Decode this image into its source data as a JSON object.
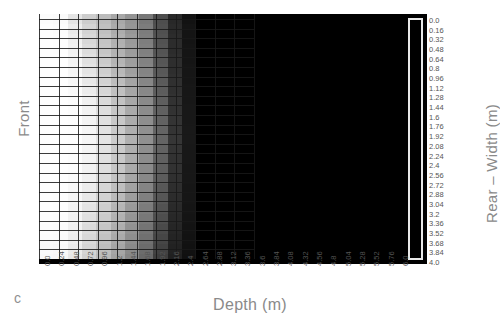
{
  "figure": {
    "panel_letter": "c",
    "left_axis_title": "Front",
    "right_axis_title": "Rear – Width (m)",
    "bottom_axis_title": "Depth (m)",
    "background_color": "#ffffff",
    "plot_background_color": "#000000",
    "gridline_color": "#191919",
    "colorbar": {
      "orientation": "vertical",
      "border_color": "#e8e8e8",
      "fill_color": "#000000",
      "min_label": "0.0",
      "max_label": "4.0"
    }
  },
  "chart_data": {
    "type": "heatmap",
    "title": "",
    "xlabel": "Depth (m)",
    "ylabel": "Front",
    "colorbar_label": "Rear – Width (m)",
    "xlim": [
      0.0,
      6.0
    ],
    "ylim": [
      0.0,
      4.0
    ],
    "x_tick_step": 0.24,
    "y_tick_step": 0.16,
    "grid": true,
    "colormap": "grayscale",
    "xticks": [
      "0.0",
      "0.24",
      "0.48",
      "0.72",
      "0.96",
      "1.2",
      "1.44",
      "1.68",
      "1.92",
      "2.16",
      "2.4",
      "2.64",
      "2.88",
      "3.12",
      "3.36",
      "3.6",
      "3.84",
      "4.08",
      "4.32",
      "4.56",
      "4.8",
      "5.04",
      "5.28",
      "5.52",
      "5.76",
      "6.0"
    ],
    "yticks": [
      "0.0",
      "0.16",
      "0.32",
      "0.48",
      "0.64",
      "0.8",
      "0.96",
      "1.12",
      "1.28",
      "1.44",
      "1.6",
      "1.76",
      "1.92",
      "2.08",
      "2.24",
      "2.4",
      "2.56",
      "2.72",
      "2.88",
      "3.04",
      "3.2",
      "3.36",
      "3.52",
      "3.68",
      "3.84",
      "4.0"
    ],
    "n_cols": 26,
    "n_rows": 25,
    "data_columns_filled": 11,
    "value_range": [
      0,
      255
    ],
    "note": "Grayscale intensity grid: bright (white) at left columns fading to black toward larger depth; region beyond ~2.5 m depth is uniformly black.",
    "rows": [
      [
        252,
        250,
        228,
        205,
        188,
        168,
        148,
        120,
        78,
        40,
        18,
        0,
        0,
        0,
        0,
        0,
        0,
        0,
        0,
        0,
        0,
        0,
        0,
        0,
        0,
        0
      ],
      [
        254,
        252,
        236,
        212,
        192,
        172,
        150,
        124,
        80,
        42,
        20,
        0,
        0,
        0,
        0,
        0,
        0,
        0,
        0,
        0,
        0,
        0,
        0,
        0,
        0,
        0
      ],
      [
        254,
        253,
        240,
        216,
        196,
        176,
        154,
        126,
        82,
        44,
        20,
        0,
        0,
        0,
        0,
        0,
        0,
        0,
        0,
        0,
        0,
        0,
        0,
        0,
        0,
        0
      ],
      [
        254,
        253,
        242,
        220,
        198,
        178,
        156,
        128,
        84,
        44,
        21,
        0,
        0,
        0,
        0,
        0,
        0,
        0,
        0,
        0,
        0,
        0,
        0,
        0,
        0,
        0
      ],
      [
        254,
        254,
        244,
        224,
        202,
        180,
        158,
        130,
        86,
        46,
        21,
        0,
        0,
        0,
        0,
        0,
        0,
        0,
        0,
        0,
        0,
        0,
        0,
        0,
        0,
        0
      ],
      [
        254,
        254,
        246,
        228,
        206,
        184,
        160,
        132,
        88,
        46,
        22,
        0,
        0,
        0,
        0,
        0,
        0,
        0,
        0,
        0,
        0,
        0,
        0,
        0,
        0,
        0
      ],
      [
        254,
        254,
        248,
        232,
        210,
        188,
        164,
        134,
        90,
        48,
        22,
        0,
        0,
        0,
        0,
        0,
        0,
        0,
        0,
        0,
        0,
        0,
        0,
        0,
        0,
        0
      ],
      [
        254,
        254,
        250,
        236,
        214,
        192,
        166,
        136,
        92,
        48,
        23,
        0,
        0,
        0,
        0,
        0,
        0,
        0,
        0,
        0,
        0,
        0,
        0,
        0,
        0,
        0
      ],
      [
        254,
        254,
        252,
        240,
        218,
        194,
        168,
        138,
        94,
        50,
        23,
        0,
        0,
        0,
        0,
        0,
        0,
        0,
        0,
        0,
        0,
        0,
        0,
        0,
        0,
        0
      ],
      [
        254,
        254,
        252,
        242,
        222,
        198,
        170,
        140,
        96,
        50,
        24,
        0,
        0,
        0,
        0,
        0,
        0,
        0,
        0,
        0,
        0,
        0,
        0,
        0,
        0,
        0
      ],
      [
        254,
        254,
        253,
        244,
        224,
        200,
        172,
        142,
        98,
        52,
        24,
        0,
        0,
        0,
        0,
        0,
        0,
        0,
        0,
        0,
        0,
        0,
        0,
        0,
        0,
        0
      ],
      [
        254,
        254,
        253,
        246,
        226,
        202,
        174,
        144,
        100,
        52,
        25,
        0,
        0,
        0,
        0,
        0,
        0,
        0,
        0,
        0,
        0,
        0,
        0,
        0,
        0,
        0
      ],
      [
        254,
        254,
        253,
        246,
        228,
        204,
        176,
        144,
        100,
        54,
        25,
        0,
        0,
        0,
        0,
        0,
        0,
        0,
        0,
        0,
        0,
        0,
        0,
        0,
        0,
        0
      ],
      [
        254,
        254,
        253,
        245,
        226,
        202,
        174,
        142,
        98,
        52,
        24,
        0,
        0,
        0,
        0,
        0,
        0,
        0,
        0,
        0,
        0,
        0,
        0,
        0,
        0,
        0
      ],
      [
        254,
        254,
        252,
        244,
        224,
        200,
        172,
        140,
        96,
        50,
        24,
        0,
        0,
        0,
        0,
        0,
        0,
        0,
        0,
        0,
        0,
        0,
        0,
        0,
        0,
        0
      ],
      [
        254,
        254,
        252,
        242,
        222,
        198,
        170,
        138,
        94,
        50,
        23,
        0,
        0,
        0,
        0,
        0,
        0,
        0,
        0,
        0,
        0,
        0,
        0,
        0,
        0,
        0
      ],
      [
        254,
        254,
        250,
        240,
        218,
        194,
        166,
        136,
        92,
        48,
        23,
        0,
        0,
        0,
        0,
        0,
        0,
        0,
        0,
        0,
        0,
        0,
        0,
        0,
        0,
        0
      ],
      [
        254,
        254,
        248,
        236,
        214,
        190,
        162,
        132,
        88,
        46,
        22,
        0,
        0,
        0,
        0,
        0,
        0,
        0,
        0,
        0,
        0,
        0,
        0,
        0,
        0,
        0
      ],
      [
        254,
        253,
        246,
        232,
        210,
        186,
        158,
        128,
        86,
        44,
        22,
        0,
        0,
        0,
        0,
        0,
        0,
        0,
        0,
        0,
        0,
        0,
        0,
        0,
        0,
        0
      ],
      [
        254,
        253,
        244,
        228,
        206,
        182,
        154,
        124,
        82,
        42,
        21,
        0,
        0,
        0,
        0,
        0,
        0,
        0,
        0,
        0,
        0,
        0,
        0,
        0,
        0,
        0
      ],
      [
        253,
        252,
        242,
        224,
        202,
        178,
        150,
        120,
        78,
        40,
        20,
        0,
        0,
        0,
        0,
        0,
        0,
        0,
        0,
        0,
        0,
        0,
        0,
        0,
        0,
        0
      ],
      [
        252,
        251,
        240,
        220,
        198,
        174,
        146,
        116,
        74,
        38,
        19,
        0,
        0,
        0,
        0,
        0,
        0,
        0,
        0,
        0,
        0,
        0,
        0,
        0,
        0,
        0
      ],
      [
        251,
        250,
        238,
        216,
        194,
        170,
        142,
        112,
        70,
        36,
        18,
        0,
        0,
        0,
        0,
        0,
        0,
        0,
        0,
        0,
        0,
        0,
        0,
        0,
        0,
        0
      ],
      [
        250,
        248,
        234,
        212,
        190,
        166,
        138,
        108,
        66,
        34,
        17,
        0,
        0,
        0,
        0,
        0,
        0,
        0,
        0,
        0,
        0,
        0,
        0,
        0,
        0,
        0
      ],
      [
        248,
        246,
        230,
        208,
        186,
        162,
        134,
        104,
        62,
        32,
        16,
        0,
        0,
        0,
        0,
        0,
        0,
        0,
        0,
        0,
        0,
        0,
        0,
        0,
        0,
        0
      ]
    ]
  }
}
